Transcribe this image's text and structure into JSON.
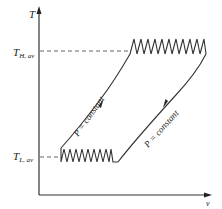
{
  "diagram": {
    "type": "T-v diagram",
    "axes": {
      "y_label": "T",
      "x_label": "v"
    },
    "levels": {
      "high": {
        "symbol": "T",
        "subscript": "H, av"
      },
      "low": {
        "symbol": "T",
        "subscript": "L, av"
      }
    },
    "processes": [
      {
        "name": "left-isobar",
        "label": "P = constant",
        "direction": "up"
      },
      {
        "name": "right-isobar",
        "label": "P = constant",
        "direction": "down"
      }
    ],
    "colors": {
      "line": "#333333",
      "dashed": "#555555"
    }
  }
}
